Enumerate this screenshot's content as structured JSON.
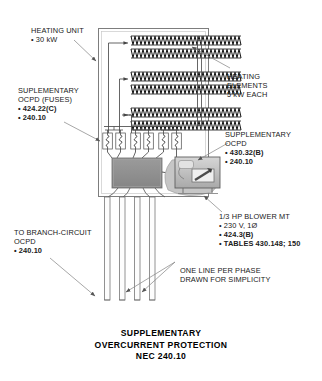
{
  "diagram": {
    "title_lines": [
      "SUPPLEMENTARY",
      "OVERCURRENT PROTECTION",
      "NEC 240.10"
    ],
    "labels": {
      "heating_unit": {
        "lines": [
          "HEATING UNIT",
          "• 30 kW"
        ],
        "text": "HEATING UNIT\n• 30 kW"
      },
      "suplementary_ocpd_fuses": {
        "lines": [
          "SUPLEMENTARY",
          "OCPD (FUSES)",
          "• 424.22(C)",
          "• 240.10"
        ],
        "heading": "SUPLEMENTARY\nOCPD (FUSES)",
        "refs": "• 424.22(C)\n• 240.10"
      },
      "heating_elements": {
        "lines": [
          "HEATING",
          "ELEMENTS",
          "5 kW EACH"
        ],
        "text": "HEATING\nELEMENTS\n5 kW EACH"
      },
      "supplementary_ocpd_motor": {
        "lines": [
          "SUPPLEMENTARY",
          "OCPD",
          "• 430.32(B)",
          "• 240.10"
        ],
        "heading": "SUPPLEMENTARY\nOCPD",
        "refs": "• 430.32(B)\n• 240.10"
      },
      "blower_motor": {
        "lines": [
          "1/3 HP BLOWER MT",
          "• 230 V, 1Ø",
          "• 424.3(B)",
          "• TABLES 430.148; 150"
        ],
        "heading": "1/3 HP BLOWER MT\n• 230 V, 1Ø",
        "refs": "• 424.3(B)\n• TABLES 430.148; 150"
      },
      "branch_circuit_ocpd": {
        "lines": [
          "TO BRANCH-CIRCUIT",
          "OCPD",
          "• 240.10"
        ],
        "heading": "TO BRANCH-CIRCUIT\nOCPD",
        "refs": "• 240.10"
      },
      "one_line_note": {
        "lines": [
          "ONE LINE PER PHASE",
          "DRAWN FOR SIMPLICITY"
        ],
        "text": "ONE LINE PER PHASE\nDRAWN FOR SIMPLICITY"
      }
    },
    "components": {
      "cabinet": "heating-unit-cabinet",
      "heating_element_count": 6,
      "fuse_group_count": 3,
      "fuses_per_group": 2,
      "terminal_block": "gray-terminal-block",
      "blower_photo": "blower-motor-image",
      "feeder_conductor_count": 4
    },
    "colors": {
      "line": "#4a4a4a",
      "coil": "#1c1c1c",
      "terminal_block_fill": "#8f8f8f",
      "blower_fill": "#b9b9b9",
      "text": "#202020",
      "background": "#ffffff"
    }
  }
}
